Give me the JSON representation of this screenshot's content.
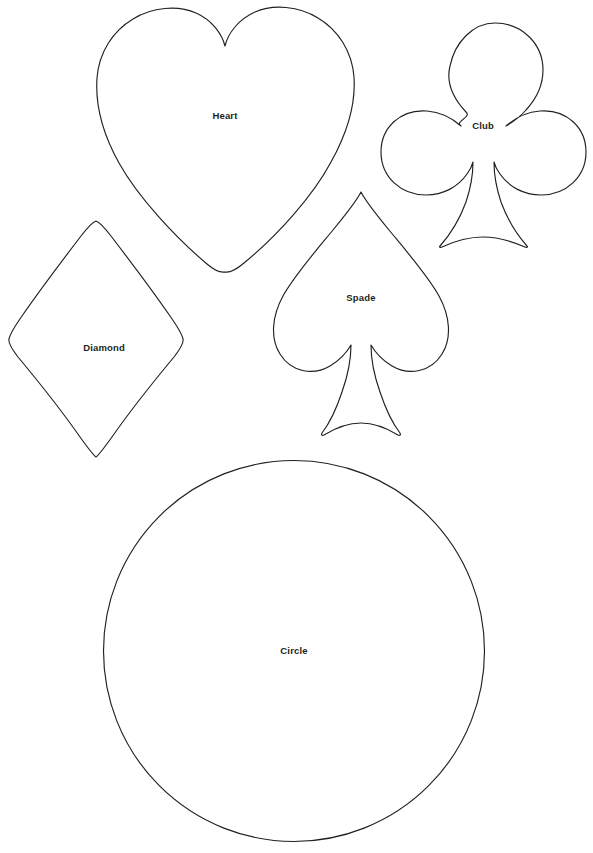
{
  "page": {
    "background_color": "#ffffff",
    "stroke_color": "#231f20",
    "label_color": "#231f20",
    "width": 593,
    "height": 853
  },
  "shapes": [
    {
      "name": "heart",
      "label": "Heart",
      "icon": "heart-icon",
      "label_x": 225,
      "label_y": 116,
      "bounds": {
        "x": 96,
        "y": 8,
        "width": 262,
        "height": 264
      }
    },
    {
      "name": "club",
      "label": "Club",
      "icon": "club-icon",
      "label_x": 483,
      "label_y": 126,
      "bounds": {
        "x": 378,
        "y": 22,
        "width": 207,
        "height": 225
      }
    },
    {
      "name": "spade",
      "label": "Spade",
      "icon": "spade-icon",
      "label_x": 361,
      "label_y": 298,
      "bounds": {
        "x": 272,
        "y": 190,
        "width": 178,
        "height": 246
      }
    },
    {
      "name": "diamond",
      "label": "Diamond",
      "icon": "diamond-icon",
      "label_x": 104,
      "label_y": 348,
      "bounds": {
        "x": 8,
        "y": 220,
        "width": 175,
        "height": 265
      }
    },
    {
      "name": "circle",
      "label": "Circle",
      "icon": "circle-icon",
      "label_x": 294,
      "label_y": 651,
      "bounds": {
        "x": 103,
        "y": 460,
        "width": 382,
        "height": 382
      }
    }
  ]
}
